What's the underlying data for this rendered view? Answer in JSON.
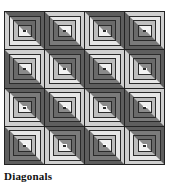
{
  "caption": "Diagonals",
  "quilt": {
    "rows": 4,
    "cols": 4,
    "colors": {
      "dark": "#6e6e6e",
      "mid": "#9a9a9a",
      "light": "#d6d6d6",
      "lighter": "#ececec",
      "center": "#ffffff",
      "line": "#2a2a2a"
    },
    "orientations": [
      [
        "tr",
        "bl",
        "tr",
        "bl"
      ],
      [
        "bl",
        "tr",
        "bl",
        "tr"
      ],
      [
        "tr",
        "bl",
        "tr",
        "bl"
      ],
      [
        "bl",
        "tr",
        "bl",
        "tr"
      ]
    ]
  }
}
